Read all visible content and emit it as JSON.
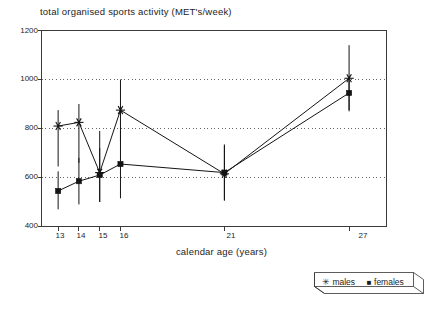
{
  "chart_data": {
    "type": "line",
    "title": "total organised sports activity (MET's/week)",
    "xlabel": "calendar age (years)",
    "ylabel": "",
    "x": [
      13,
      14,
      15,
      16,
      21,
      27
    ],
    "categories": [
      "13",
      "14",
      "15",
      "16",
      "21",
      "27"
    ],
    "xtick_labels": [
      "13",
      "14",
      "15",
      "16",
      "21",
      "27"
    ],
    "ytick_labels": [
      "400",
      "600",
      "800",
      "1000",
      "1200"
    ],
    "yticks": [
      400,
      600,
      800,
      1000,
      1200
    ],
    "ylim": [
      400,
      1200
    ],
    "xlim": [
      12.2,
      28.8
    ],
    "grid": "horizontal-dotted",
    "legend_position": "bottom-right",
    "series": [
      {
        "name": "males",
        "marker": "asterisk",
        "values": [
          810,
          825,
          620,
          875,
          615,
          1005
        ],
        "error_low": [
          645,
          660,
          500,
          745,
          505,
          875
        ],
        "error_high": [
          875,
          900,
          790,
          1000,
          735,
          1140
        ]
      },
      {
        "name": "females",
        "marker": "square",
        "values": [
          545,
          585,
          610,
          655,
          620,
          945
        ],
        "error_low": [
          470,
          490,
          500,
          515,
          510,
          870
        ],
        "error_high": [
          625,
          680,
          720,
          790,
          730,
          1015
        ]
      }
    ]
  },
  "legend": {
    "male_glyph": "✳",
    "male_label": "males",
    "female_glyph": "■",
    "female_label": "females"
  }
}
